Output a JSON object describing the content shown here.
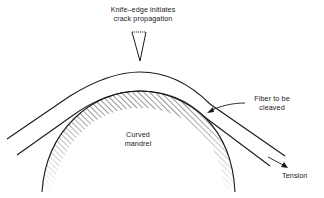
{
  "diagram": {
    "labels": {
      "knife_line1": "Knife–edge initiates",
      "knife_line2": "crack propagation",
      "fiber_line1": "Fiber to be",
      "fiber_line2": "cleaved",
      "mandrel_line1": "Curved",
      "mandrel_line2": "mandrel",
      "tension": "Tension"
    },
    "components": [
      {
        "id": "knife-edge",
        "shape": "inverted-triangle"
      },
      {
        "id": "fiber",
        "shape": "curved-band"
      },
      {
        "id": "mandrel",
        "shape": "hatched-arc"
      },
      {
        "id": "tension-arrow",
        "shape": "arrow"
      },
      {
        "id": "fiber-pointer",
        "shape": "curved-arrow"
      }
    ],
    "colors": {
      "stroke": "#1a1a1a",
      "background": "#ffffff"
    }
  }
}
